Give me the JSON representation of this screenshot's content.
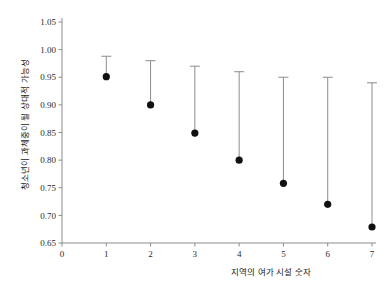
{
  "chart_data": {
    "type": "scatter",
    "title": "",
    "subtitle": "",
    "xlabel": "지역의 여가 시설 숫자",
    "ylabel": "청소년이 과체중이 될 상대적 가능성",
    "x": [
      1,
      2,
      3,
      4,
      5,
      6,
      7
    ],
    "values": [
      0.951,
      0.9,
      0.849,
      0.8,
      0.758,
      0.72,
      0.679
    ],
    "error_upper": [
      0.988,
      0.98,
      0.97,
      0.96,
      0.95,
      0.95,
      0.94
    ],
    "error_lower": [
      0.951,
      0.9,
      0.849,
      0.8,
      0.758,
      0.72,
      0.679
    ],
    "series": [
      {
        "name": "상대적 가능성",
        "values": [
          0.951,
          0.9,
          0.849,
          0.8,
          0.758,
          0.72,
          0.679
        ]
      }
    ],
    "xlim": [
      0,
      7
    ],
    "ylim": [
      0.65,
      1.05
    ],
    "xticks": [
      0,
      1,
      2,
      3,
      4,
      5,
      6,
      7
    ],
    "yticks": [
      0.65,
      0.7,
      0.75,
      0.8,
      0.85,
      0.9,
      0.95,
      1.0,
      1.05
    ],
    "xtick_labels": [
      "0",
      "1",
      "2",
      "3",
      "4",
      "5",
      "6",
      "7"
    ],
    "ytick_labels": [
      "0.65",
      "0.70",
      "0.75",
      "0.80",
      "0.85",
      "0.90",
      "0.95",
      "1.00",
      "1.05"
    ],
    "grid": false,
    "legend": false,
    "legend_position": "none",
    "marker": "filled-circle",
    "errorbar_direction": "upward-only",
    "colors": {
      "marker": "#111111",
      "errorbar": "#8c8c8c",
      "axis": "#8c8c8c",
      "text": "#2b2b2b",
      "background": "#ffffff"
    }
  }
}
